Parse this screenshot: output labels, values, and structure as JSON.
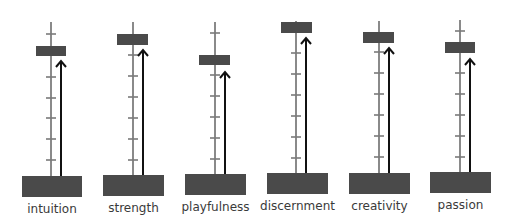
{
  "diagram": {
    "type": "strength-meters",
    "colors": {
      "pole": "#8a8a8a",
      "tick": "#7a7a7a",
      "block": "#4a4a4a",
      "base": "#4a4a4a",
      "arrow": "#111111",
      "label": "#3a3a3a"
    },
    "meters": [
      {
        "label": "intuition",
        "pole_x": 51,
        "pole_top": 22,
        "pole_bottom": 176,
        "block": {
          "x": 36,
          "y": 46,
          "w": 30,
          "h": 10
        },
        "arrow_x": 61,
        "arrow_top": 61,
        "base": {
          "x": 22,
          "y": 176,
          "w": 60,
          "h": 21
        },
        "ticks": [
          34,
          77,
          98,
          118,
          139,
          160
        ],
        "label_y": 202
      },
      {
        "label": "strength",
        "pole_x": 133,
        "pole_top": 22,
        "pole_bottom": 175,
        "block": {
          "x": 117,
          "y": 34,
          "w": 31,
          "h": 11
        },
        "arrow_x": 143,
        "arrow_top": 50,
        "base": {
          "x": 103,
          "y": 175,
          "w": 61,
          "h": 21
        },
        "ticks": [
          55,
          76,
          97,
          118,
          139,
          160
        ],
        "label_y": 201
      },
      {
        "label": "playfulness",
        "pole_x": 215,
        "pole_top": 22,
        "pole_bottom": 174,
        "block": {
          "x": 199,
          "y": 55,
          "w": 31,
          "h": 10
        },
        "arrow_x": 225,
        "arrow_top": 72,
        "base": {
          "x": 185,
          "y": 174,
          "w": 61,
          "h": 21
        },
        "ticks": [
          33,
          75,
          96,
          117,
          138,
          159
        ],
        "label_y": 200
      },
      {
        "label": "discernment",
        "pole_x": 296,
        "pole_top": 21,
        "pole_bottom": 173,
        "block": {
          "x": 281,
          "y": 22,
          "w": 31,
          "h": 11
        },
        "arrow_x": 306,
        "arrow_top": 38,
        "base": {
          "x": 267,
          "y": 173,
          "w": 61,
          "h": 21
        },
        "ticks": [
          53,
          74,
          95,
          116,
          137,
          158
        ],
        "label_y": 199
      },
      {
        "label": "creativity",
        "pole_x": 379,
        "pole_top": 21,
        "pole_bottom": 173,
        "block": {
          "x": 363,
          "y": 32,
          "w": 31,
          "h": 11
        },
        "arrow_x": 389,
        "arrow_top": 48,
        "base": {
          "x": 349,
          "y": 173,
          "w": 61,
          "h": 21
        },
        "ticks": [
          52,
          73,
          94,
          115,
          136,
          157
        ],
        "label_y": 199
      },
      {
        "label": "passion",
        "pole_x": 460,
        "pole_top": 20,
        "pole_bottom": 172,
        "block": {
          "x": 445,
          "y": 42,
          "w": 30,
          "h": 11
        },
        "arrow_x": 470,
        "arrow_top": 59,
        "base": {
          "x": 430,
          "y": 172,
          "w": 61,
          "h": 21
        },
        "ticks": [
          31,
          73,
          94,
          115,
          136,
          157
        ],
        "label_y": 198
      }
    ]
  }
}
